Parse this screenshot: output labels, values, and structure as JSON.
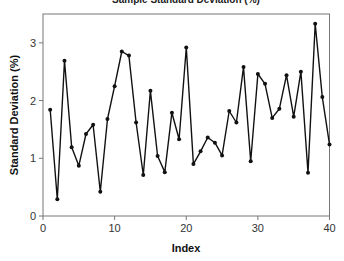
{
  "chart_data": {
    "type": "line",
    "title": "Sample Standard Deviation (%)",
    "xlabel": "Index",
    "ylabel": "Standard Deviation (%)",
    "xlim": [
      0,
      40
    ],
    "ylim": [
      0,
      3.5
    ],
    "xticks": [
      0,
      10,
      20,
      30,
      40
    ],
    "yticks": [
      0,
      1,
      2,
      3
    ],
    "grid": false,
    "legend": null,
    "marker": "circle",
    "line_color": "#111111",
    "series": [
      {
        "name": "Standard Deviation",
        "x": [
          1,
          2,
          3,
          4,
          5,
          6,
          7,
          8,
          9,
          10,
          11,
          12,
          13,
          14,
          15,
          16,
          17,
          18,
          19,
          20,
          21,
          22,
          23,
          24,
          25,
          26,
          27,
          28,
          29,
          30,
          31,
          32,
          33,
          34,
          35,
          36,
          37,
          38,
          39,
          40
        ],
        "values": [
          1.84,
          0.29,
          2.69,
          1.19,
          0.87,
          1.42,
          1.58,
          0.42,
          1.68,
          2.25,
          2.85,
          2.78,
          1.62,
          0.71,
          2.17,
          1.04,
          0.76,
          1.79,
          1.33,
          2.92,
          0.9,
          1.12,
          1.36,
          1.27,
          1.05,
          1.82,
          1.62,
          2.58,
          0.95,
          2.46,
          2.29,
          1.7,
          1.86,
          2.44,
          1.72,
          2.5,
          0.75,
          3.33,
          2.06,
          1.24
        ]
      }
    ]
  }
}
